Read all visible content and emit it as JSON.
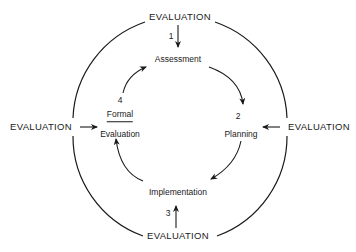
{
  "diagram": {
    "title": "",
    "outer_labels": {
      "top": "EVALUATION",
      "left": "EVALUATION",
      "right": "EVALUATION",
      "bottom": "EVALUATION"
    },
    "nodes": [
      {
        "step": "1",
        "label": "Assessment"
      },
      {
        "step": "2",
        "label": "Planning"
      },
      {
        "step": "3",
        "label": "Implementation"
      },
      {
        "step": "4",
        "label_top": "Formal",
        "label_bottom": "Evaluation"
      }
    ],
    "colors": {
      "line": "#1a1a1a",
      "background": "#ffffff"
    }
  }
}
